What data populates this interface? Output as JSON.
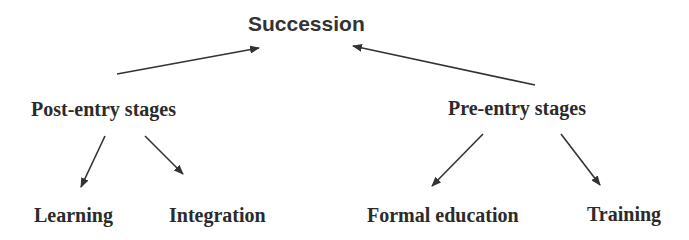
{
  "diagram": {
    "root": {
      "label": "Succession"
    },
    "branches": [
      {
        "label": "Post-entry stages",
        "children": [
          {
            "label": "Learning"
          },
          {
            "label": "Integration"
          }
        ]
      },
      {
        "label": "Pre-entry stages",
        "children": [
          {
            "label": "Formal education"
          },
          {
            "label": "Training"
          }
        ]
      }
    ],
    "colors": {
      "text": "#2b2b2b",
      "arrow": "#333333",
      "background": "#ffffff"
    }
  }
}
